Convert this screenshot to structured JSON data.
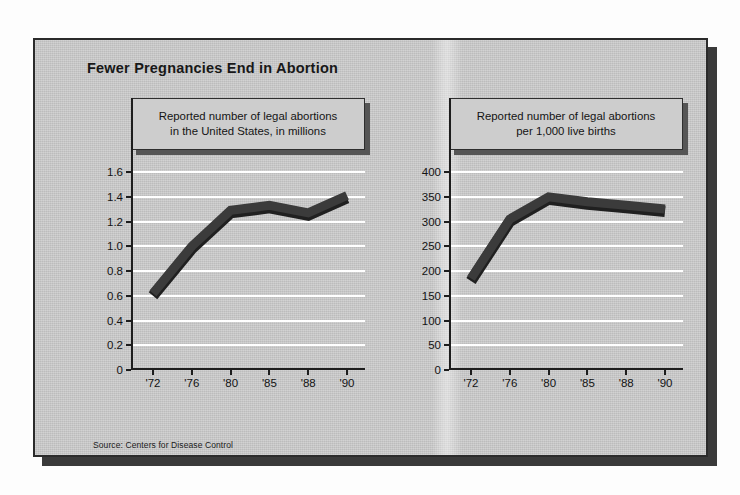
{
  "headline": "Fewer Pregnancies End in Abortion",
  "source": "Source: Centers for Disease Control",
  "colors": {
    "paper": "#c9c9c9",
    "frame": "#2b2b2b",
    "gridline": "#ffffff",
    "line": "#3b3b3b",
    "line_dark": "#202020",
    "text": "#141414",
    "shadow": "#3a3a3a"
  },
  "panels": {
    "left": {
      "caption_line1": "Reported number of legal abortions",
      "caption_line2": "in the United States, in millions"
    },
    "right": {
      "caption_line1": "Reported number of legal abortions",
      "caption_line2": "per 1,000 live births"
    }
  },
  "chart_data": [
    {
      "type": "line",
      "id": "abortions-millions",
      "title": "Reported number of legal abortions in the United States, in millions",
      "xlabel": "",
      "ylabel": "",
      "categories": [
        "'72",
        "'76",
        "'80",
        "'85",
        "'88",
        "'90"
      ],
      "values": [
        0.62,
        1.0,
        1.29,
        1.33,
        1.27,
        1.41
      ],
      "yticks": [
        "1.6",
        "1.4",
        "1.2",
        "1.0",
        "0.8",
        "0.6",
        "0.4",
        "0.2",
        "0"
      ],
      "ytick_values": [
        1.6,
        1.4,
        1.2,
        1.0,
        0.8,
        0.6,
        0.4,
        0.2,
        0
      ],
      "ylim": [
        0,
        1.6
      ],
      "grid": true,
      "legend": "none"
    },
    {
      "type": "line",
      "id": "abortions-per-1000-births",
      "title": "Reported number of legal abortions per 1,000 live births",
      "xlabel": "",
      "ylabel": "",
      "categories": [
        "'72",
        "'76",
        "'80",
        "'85",
        "'88",
        "'90"
      ],
      "values": [
        185,
        305,
        350,
        340,
        333,
        325
      ],
      "yticks": [
        "400",
        "350",
        "300",
        "250",
        "200",
        "150",
        "100",
        "50",
        "0"
      ],
      "ytick_values": [
        400,
        350,
        300,
        250,
        200,
        150,
        100,
        50,
        0
      ],
      "ylim": [
        0,
        400
      ],
      "grid": true,
      "legend": "none"
    }
  ]
}
